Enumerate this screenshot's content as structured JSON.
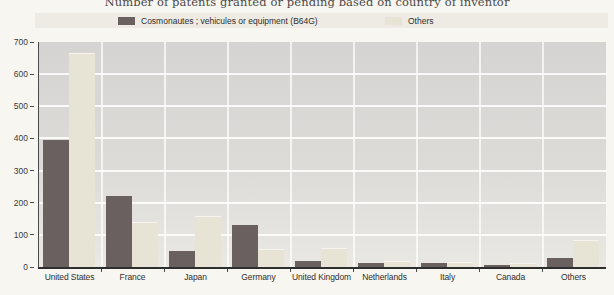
{
  "page": {
    "title": "Number of patents granted or pending based on country of inventor"
  },
  "colors": {
    "series_b64g": "#6b6060",
    "series_others": "#e7e3d5",
    "plot_background": "#dcdbd8",
    "gridline": "#ffffff",
    "axis": "#2e2e2e",
    "page_background": "#f8f6f1"
  },
  "chart_data": {
    "type": "bar",
    "title": "Number of patents granted or pending based on country of inventor",
    "categories": [
      "United States",
      "France",
      "Japan",
      "Germany",
      "United Kingdom",
      "Netherlands",
      "Italy",
      "Canada",
      "Others"
    ],
    "series": [
      {
        "name": "Cosmonautes ; vehicules or equipment (B64G)",
        "color": "#6b6060",
        "values": [
          395,
          220,
          50,
          132,
          20,
          12,
          12,
          5,
          28
        ]
      },
      {
        "name": "Others",
        "color": "#e7e3d5",
        "values": [
          665,
          140,
          158,
          55,
          60,
          20,
          16,
          13,
          85
        ]
      }
    ],
    "xlabel": "",
    "ylabel": "",
    "ylim": [
      0,
      700
    ],
    "yticks": [
      0,
      100,
      200,
      300,
      400,
      500,
      600,
      700
    ],
    "grid": true,
    "legend_position": "top"
  }
}
